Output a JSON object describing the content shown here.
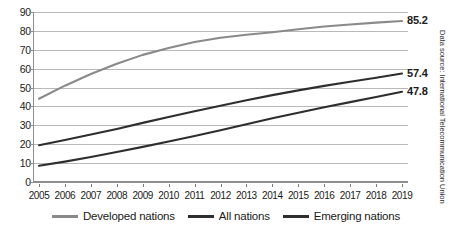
{
  "chart_data": {
    "type": "line",
    "title": "",
    "xlabel": "",
    "ylabel": "",
    "ylim": [
      0,
      90
    ],
    "ytick_step": 10,
    "yticks": [
      "0",
      "10",
      "20",
      "30",
      "40",
      "50",
      "60",
      "70",
      "80",
      "90"
    ],
    "grid": true,
    "legend_position": "bottom",
    "categories": [
      "2005",
      "2006",
      "2007",
      "2008",
      "2009",
      "2010",
      "2011",
      "2012",
      "2013",
      "2014",
      "2015",
      "2016",
      "2017",
      "2018",
      "2019"
    ],
    "series": [
      {
        "name": "Developed nations",
        "color": "#8a8a8a",
        "end_label": "85.2",
        "values": [
          44.1,
          51.0,
          57.2,
          62.6,
          67.3,
          70.9,
          74.1,
          76.4,
          78.0,
          79.3,
          80.9,
          82.3,
          83.4,
          84.4,
          85.2
        ]
      },
      {
        "name": "All nations",
        "color": "#2e2e2e",
        "end_label": "57.4",
        "values": [
          19.5,
          22.2,
          25.1,
          28.1,
          31.3,
          34.4,
          37.5,
          40.4,
          43.3,
          46.0,
          48.5,
          50.9,
          53.1,
          55.2,
          57.4
        ]
      },
      {
        "name": "Emerging nations",
        "color": "#2e2e2e",
        "end_label": "47.8",
        "values": [
          8.6,
          10.8,
          13.2,
          15.9,
          18.6,
          21.4,
          24.4,
          27.4,
          30.6,
          33.7,
          36.7,
          39.6,
          42.3,
          45.0,
          47.8
        ]
      }
    ],
    "annotations": [
      {
        "name": "developed-end-value",
        "text": "85.2"
      },
      {
        "name": "all-end-value",
        "text": "57.4"
      },
      {
        "name": "emerging-end-value",
        "text": "47.8"
      }
    ]
  },
  "legend": {
    "items": [
      {
        "label": "Developed nations",
        "color": "#8a8a8a"
      },
      {
        "label": "All nations",
        "color": "#2e2e2e"
      },
      {
        "label": "Emerging nations",
        "color": "#2e2e2e"
      }
    ]
  },
  "source": {
    "text": "Data source: International Telecommunication Union"
  },
  "colors": {
    "developed": "#8a8a8a",
    "dark_series": "#2e2e2e",
    "gridline": "#b9b9b9",
    "axis": "#8e8e8e",
    "text": "#1a1a1a",
    "background": "#ffffff"
  }
}
